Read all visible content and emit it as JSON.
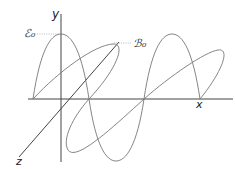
{
  "diagram": {
    "axes": {
      "x_label": "x",
      "y_label": "y",
      "z_label": "z"
    },
    "labels": {
      "electric_amplitude": "ℰ₀",
      "magnetic_amplitude": "ℬ₀"
    },
    "colors": {
      "axis": "#444444",
      "wave": "#777777",
      "leader": "#999999",
      "background": "#ffffff"
    }
  }
}
